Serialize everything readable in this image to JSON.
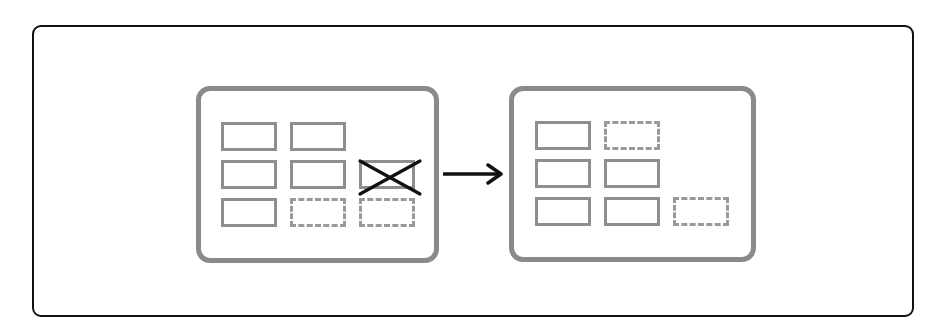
{
  "diagram": {
    "type": "before-after-grid-reflow",
    "colors": {
      "frame": "#111111",
      "panel_border": "#8a8a8a",
      "item_border": "#8e8e8e",
      "placeholder_border": "#9a9a9a",
      "delete_mark": "#111111",
      "arrow": "#111111"
    },
    "before": {
      "label": "Before",
      "items": [
        {
          "id": "b1",
          "row": 1,
          "col": 1,
          "state": "filled"
        },
        {
          "id": "b2",
          "row": 1,
          "col": 2,
          "state": "filled"
        },
        {
          "id": "b3",
          "row": 2,
          "col": 1,
          "state": "filled"
        },
        {
          "id": "b4",
          "row": 2,
          "col": 2,
          "state": "filled"
        },
        {
          "id": "b5",
          "row": 2,
          "col": 3,
          "state": "deleted"
        },
        {
          "id": "b6",
          "row": 3,
          "col": 1,
          "state": "filled"
        },
        {
          "id": "b7",
          "row": 3,
          "col": 2,
          "state": "placeholder"
        },
        {
          "id": "b8",
          "row": 3,
          "col": 3,
          "state": "placeholder"
        }
      ]
    },
    "transition": {
      "icon": "arrow-right-icon",
      "label": "Reflow"
    },
    "after": {
      "label": "After",
      "items": [
        {
          "id": "a1",
          "row": 1,
          "col": 1,
          "state": "filled"
        },
        {
          "id": "a2",
          "row": 1,
          "col": 2,
          "state": "placeholder"
        },
        {
          "id": "a3",
          "row": 2,
          "col": 1,
          "state": "filled"
        },
        {
          "id": "a4",
          "row": 2,
          "col": 2,
          "state": "filled"
        },
        {
          "id": "a5",
          "row": 3,
          "col": 1,
          "state": "filled"
        },
        {
          "id": "a6",
          "row": 3,
          "col": 2,
          "state": "filled"
        },
        {
          "id": "a7",
          "row": 3,
          "col": 3,
          "state": "placeholder"
        }
      ]
    }
  }
}
